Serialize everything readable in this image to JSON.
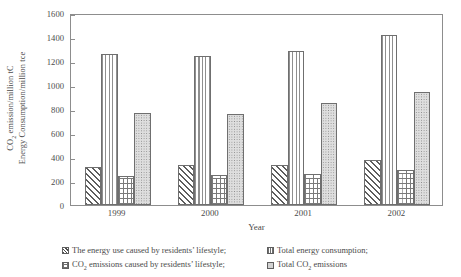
{
  "chart_data": {
    "type": "bar",
    "title": "",
    "subtitle": "",
    "xlabel": "Year",
    "ylabel_line1": "Energy Consumption/million tce",
    "ylabel_line2_pre": "CO",
    "ylabel_line2_sub": "2",
    "ylabel_line2_post": " emission/million tC",
    "categories": [
      "1999",
      "2000",
      "2001",
      "2002"
    ],
    "ylim": [
      0,
      1600
    ],
    "ytick_values": [
      0,
      200,
      400,
      600,
      800,
      1000,
      1200,
      1400,
      1600
    ],
    "ytick_labels": [
      "0",
      "200",
      "400",
      "600",
      "800",
      "1000",
      "1200",
      "1400",
      "1600"
    ],
    "grid": false,
    "legend_position": "bottom",
    "series": [
      {
        "name": "The energy use caused by residents' lifestyle;",
        "pattern": "diagonal-hatch",
        "values": [
          320,
          330,
          335,
          375
        ]
      },
      {
        "name": "Total energy consumption;",
        "pattern": "vertical-lines",
        "values": [
          1255,
          1245,
          1285,
          1420
        ]
      },
      {
        "name": "CO2 emissions caused by residents' lifestyle;",
        "pattern": "brick",
        "values": [
          245,
          250,
          255,
          290
        ]
      },
      {
        "name": "Total CO2 emissions",
        "pattern": "stipple-dots",
        "values": [
          770,
          755,
          850,
          945
        ]
      }
    ]
  },
  "legend": {
    "entries": [
      {
        "pattern": "diagonal-hatch",
        "pre": "The energy use caused by residents’ lifestyle;",
        "sub": "",
        "post": ""
      },
      {
        "pattern": "vertical-lines",
        "pre": "Total energy consumption;",
        "sub": "",
        "post": ""
      },
      {
        "pattern": "brick",
        "pre": "CO",
        "sub": "2",
        "post": " emissions caused by residents’ lifestyle;"
      },
      {
        "pattern": "stipple-dots",
        "pre": "Total CO",
        "sub": "2",
        "post": " emissions"
      }
    ]
  },
  "axis": {
    "xlabel": "Year"
  }
}
